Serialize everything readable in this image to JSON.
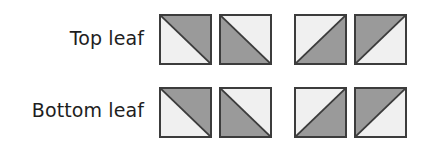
{
  "colors": {
    "light": "#f0f0f0",
    "dark": "#9a9a9a",
    "stroke": "#3c3c3c"
  },
  "rows": [
    {
      "label": "Top leaf",
      "squares": [
        {
          "diagonal": "tl-br",
          "dark": "upper-right"
        },
        {
          "diagonal": "tl-br",
          "dark": "lower-left"
        },
        {
          "diagonal": "bl-tr",
          "dark": "lower-right"
        },
        {
          "diagonal": "bl-tr",
          "dark": "upper-left"
        }
      ]
    },
    {
      "label": "Bottom leaf",
      "squares": [
        {
          "diagonal": "tl-br",
          "dark": "upper-right"
        },
        {
          "diagonal": "tl-br",
          "dark": "lower-left"
        },
        {
          "diagonal": "bl-tr",
          "dark": "lower-right"
        },
        {
          "diagonal": "bl-tr",
          "dark": "upper-left"
        }
      ]
    }
  ]
}
